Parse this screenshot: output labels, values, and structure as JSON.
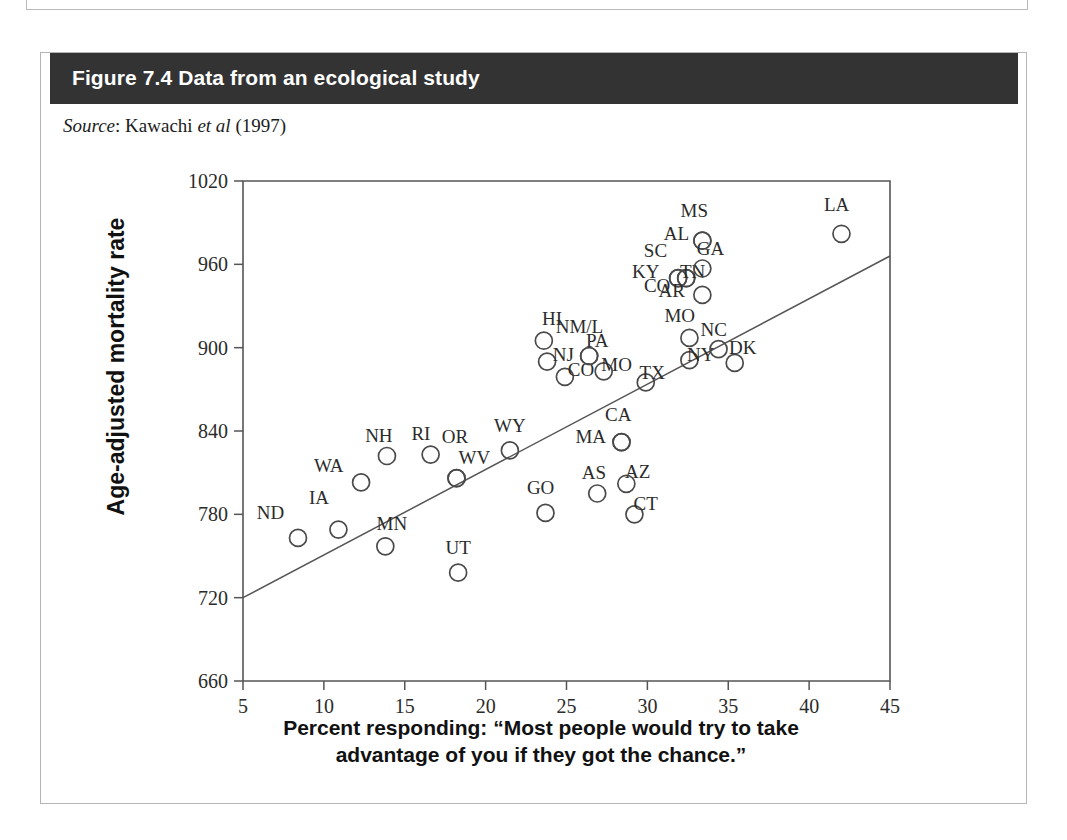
{
  "figure": {
    "title": "Figure 7.4 Data from an ecological study",
    "source_label": "Source",
    "source_sep": ": ",
    "source_author": "Kawachi ",
    "source_etal": "et al",
    "source_year": " (1997)",
    "header_color": "#333333",
    "marker_color": "#4a4a4a",
    "axis_color": "#555555"
  },
  "chart_data": {
    "type": "scatter",
    "title": "Figure 7.4 Data from an ecological study",
    "xlabel_line1": "Percent responding: “Most people would try to take",
    "xlabel_line2": "advantage of you if they got the chance.”",
    "ylabel": "Age-adjusted mortality rate",
    "xlim": [
      5,
      45
    ],
    "ylim": [
      660,
      1020
    ],
    "xticks": [
      5,
      10,
      15,
      20,
      25,
      30,
      35,
      40,
      45
    ],
    "yticks": [
      660,
      720,
      780,
      840,
      900,
      960,
      1020
    ],
    "grid": false,
    "legend": false,
    "marker_shape": "open-circle",
    "trendline": {
      "x": [
        5,
        45
      ],
      "y": [
        720,
        966
      ]
    },
    "points": [
      {
        "label": "ND",
        "x": 8.4,
        "y": 763,
        "lx": -1.7,
        "ly": 17
      },
      {
        "label": "IA",
        "x": 10.9,
        "y": 769,
        "lx": -1.2,
        "ly": 22
      },
      {
        "label": "MN",
        "x": 13.8,
        "y": 757,
        "lx": 0.4,
        "ly": 15
      },
      {
        "label": "WA",
        "x": 12.3,
        "y": 803,
        "lx": -2.0,
        "ly": 11
      },
      {
        "label": "NH",
        "x": 13.9,
        "y": 822,
        "lx": -0.5,
        "ly": 14
      },
      {
        "label": "RI",
        "x": 16.6,
        "y": 823,
        "lx": -0.6,
        "ly": 14
      },
      {
        "label": "OR",
        "x": 18.2,
        "y": 806,
        "lx": -0.1,
        "ly": 29
      },
      {
        "label": "WV",
        "x": 18.2,
        "y": 806,
        "lx": 1.1,
        "ly": 14
      },
      {
        "label": "UT",
        "x": 18.3,
        "y": 738,
        "lx": 0.0,
        "ly": 17
      },
      {
        "label": "WY",
        "x": 21.5,
        "y": 826,
        "lx": 0.0,
        "ly": 17
      },
      {
        "label": "GO",
        "x": 23.7,
        "y": 781,
        "lx": -0.3,
        "ly": 17
      },
      {
        "label": "HI",
        "x": 23.6,
        "y": 905,
        "lx": 0.5,
        "ly": 15
      },
      {
        "label": "NJ",
        "x": 23.8,
        "y": 890,
        "lx": 1.0,
        "ly": 4
      },
      {
        "label": "CO",
        "x": 24.9,
        "y": 879,
        "lx": 1.0,
        "ly": 4
      },
      {
        "label": "NM/L",
        "x": 26.4,
        "y": 894,
        "lx": -0.6,
        "ly": 20
      },
      {
        "label": "PA",
        "x": 26.4,
        "y": 894,
        "lx": 0.5,
        "ly": 10
      },
      {
        "label": "MO",
        "x": 27.3,
        "y": 883,
        "lx": 0.8,
        "ly": 4
      },
      {
        "label": "AS",
        "x": 26.9,
        "y": 795,
        "lx": -0.2,
        "ly": 14
      },
      {
        "label": "MA",
        "x": 28.4,
        "y": 832,
        "lx": -1.9,
        "ly": 3
      },
      {
        "label": "CA",
        "x": 28.4,
        "y": 832,
        "lx": -0.2,
        "ly": 19
      },
      {
        "label": "AZ",
        "x": 28.7,
        "y": 802,
        "lx": 0.7,
        "ly": 8
      },
      {
        "label": "CT",
        "x": 29.2,
        "y": 780,
        "lx": 0.7,
        "ly": 7
      },
      {
        "label": "TX",
        "x": 29.9,
        "y": 875,
        "lx": 0.4,
        "ly": 6
      },
      {
        "label": "KY",
        "x": 31.9,
        "y": 950,
        "lx": -2.0,
        "ly": 4
      },
      {
        "label": "SC",
        "x": 31.9,
        "y": 950,
        "lx": -1.4,
        "ly": 19
      },
      {
        "label": "CO",
        "x": 32.4,
        "y": 950,
        "lx": -1.8,
        "ly": -6
      },
      {
        "label": "TN",
        "x": 32.4,
        "y": 950,
        "lx": 0.4,
        "ly": 4
      },
      {
        "label": "AL",
        "x": 33.4,
        "y": 977,
        "lx": -1.6,
        "ly": 4
      },
      {
        "label": "MS",
        "x": 33.4,
        "y": 977,
        "lx": -0.5,
        "ly": 21
      },
      {
        "label": "GA",
        "x": 33.4,
        "y": 957,
        "lx": 0.5,
        "ly": 13
      },
      {
        "label": "AR",
        "x": 33.4,
        "y": 938,
        "lx": -1.9,
        "ly": 2
      },
      {
        "label": "MO",
        "x": 32.6,
        "y": 907,
        "lx": -0.6,
        "ly": 15
      },
      {
        "label": "NY",
        "x": 32.6,
        "y": 891,
        "lx": 0.7,
        "ly": 3
      },
      {
        "label": "NC",
        "x": 34.4,
        "y": 899,
        "lx": -0.3,
        "ly": 13
      },
      {
        "label": "DK",
        "x": 35.4,
        "y": 889,
        "lx": 0.5,
        "ly": 10
      },
      {
        "label": "LA",
        "x": 42.0,
        "y": 982,
        "lx": -0.3,
        "ly": 20
      }
    ]
  }
}
